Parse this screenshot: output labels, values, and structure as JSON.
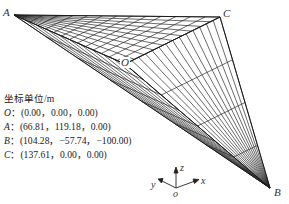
{
  "figure": {
    "points": {
      "A": {
        "label": "A",
        "px": [
          14,
          15
        ]
      },
      "O": {
        "label": "O",
        "px": [
          125,
          64
        ]
      },
      "B": {
        "label": "B",
        "px": [
          270,
          188
        ]
      },
      "C": {
        "label": "C",
        "px": [
          220,
          17
        ]
      }
    },
    "mesh_color": "#2a2a2a"
  },
  "legend": {
    "title": "坐标单位/m",
    "rows": [
      {
        "name": "O",
        "sep": "：",
        "coords": "(0.00，0.00，0.00)"
      },
      {
        "name": "A",
        "sep": "：",
        "coords": "(66.81，119.18，0.00)"
      },
      {
        "name": "B",
        "sep": "：",
        "coords": "(104.28，−57.74，−100.00)"
      },
      {
        "name": "C",
        "sep": "：",
        "coords": "(137.61，0.00，0.00)"
      }
    ]
  },
  "axes_triad": {
    "z": "z",
    "y": "y",
    "x": "x",
    "origin": "o"
  }
}
